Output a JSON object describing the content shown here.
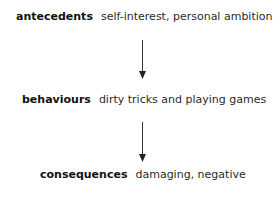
{
  "diagram": {
    "type": "flow",
    "direction": "top-to-bottom",
    "nodes": [
      {
        "term": "antecedents",
        "description": "self-interest, personal ambition"
      },
      {
        "term": "behaviours",
        "description": "dirty tricks and playing games"
      },
      {
        "term": "consequences",
        "description": "damaging, negative"
      }
    ],
    "edges": [
      {
        "from": "antecedents",
        "to": "behaviours"
      },
      {
        "from": "behaviours",
        "to": "consequences"
      }
    ],
    "colors": {
      "text": "#111111",
      "arrow": "#333333",
      "background": "#ffffff"
    }
  }
}
